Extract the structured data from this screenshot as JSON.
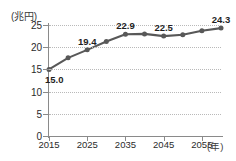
{
  "chart_data": {
    "type": "line",
    "title": "",
    "subtitle": "",
    "xlabel": "(年)",
    "ylabel": "(兆円)",
    "x": [
      2015,
      2020,
      2025,
      2030,
      2035,
      2040,
      2045,
      2050,
      2055,
      2060
    ],
    "values": [
      15.0,
      17.6,
      19.4,
      21.3,
      22.9,
      23.0,
      22.5,
      22.8,
      23.7,
      24.3
    ],
    "series": [
      {
        "name": "",
        "values": [
          15.0,
          17.6,
          19.4,
          21.3,
          22.9,
          23.0,
          22.5,
          22.8,
          23.7,
          24.3
        ]
      }
    ],
    "xlim": [
      2015,
      2060
    ],
    "ylim": [
      0,
      25
    ],
    "yticks": [
      0,
      5,
      10,
      15,
      20,
      25
    ],
    "ytick_labels": [
      "0",
      "5",
      "10",
      "15",
      "20",
      "25"
    ],
    "xticks": [
      2015,
      2025,
      2035,
      2045,
      2055
    ],
    "xtick_labels": [
      "2015",
      "2025",
      "2035",
      "2045",
      "2055"
    ],
    "grid": true,
    "grid_axis": "y",
    "grid_style": "dotted",
    "legend": false,
    "legend_position": "none",
    "marker": "circle",
    "data_labels": [
      {
        "x": 2015,
        "value": 15.0,
        "text": "15.0",
        "position": "below-right"
      },
      {
        "x": 2025,
        "value": 19.4,
        "text": "19.4",
        "position": "above"
      },
      {
        "x": 2035,
        "value": 22.9,
        "text": "22.9",
        "position": "above"
      },
      {
        "x": 2045,
        "value": 22.5,
        "text": "22.5",
        "position": "above"
      },
      {
        "x": 2060,
        "value": 24.3,
        "text": "24.3",
        "position": "above"
      }
    ],
    "colors": {
      "line": "#585858",
      "marker": "#585858",
      "gridline": "#b9b9b9",
      "axis": "#8a8a8a",
      "text": "#2b2b2b",
      "background": "#ffffff"
    }
  }
}
